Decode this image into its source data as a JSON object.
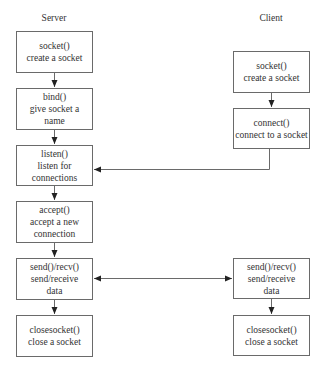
{
  "columns": {
    "server": {
      "title": "Server"
    },
    "client": {
      "title": "Client"
    }
  },
  "server_steps": [
    {
      "call": "socket()",
      "lines": [
        "create a socket"
      ]
    },
    {
      "call": "bind()",
      "lines": [
        "give socket a",
        "name"
      ]
    },
    {
      "call": "listen()",
      "lines": [
        "listen for",
        "connections"
      ]
    },
    {
      "call": "accept()",
      "lines": [
        "accept a new",
        "connection"
      ]
    },
    {
      "call": "send()/recv()",
      "lines": [
        "send/receive",
        "data"
      ]
    },
    {
      "call": "closesocket()",
      "lines": [
        "close a socket"
      ]
    }
  ],
  "client_steps": [
    {
      "call": "socket()",
      "lines": [
        "create a socket"
      ]
    },
    {
      "call": "connect()",
      "lines": [
        "connect to a socket"
      ]
    },
    {
      "call": "send()/recv()",
      "lines": [
        "send/receive",
        "data"
      ]
    },
    {
      "call": "closesocket()",
      "lines": [
        "close a socket"
      ]
    }
  ],
  "edges": [
    {
      "from": "server.socket",
      "to": "server.bind",
      "type": "arrow"
    },
    {
      "from": "server.bind",
      "to": "server.listen",
      "type": "arrow"
    },
    {
      "from": "server.listen",
      "to": "server.accept",
      "type": "arrow"
    },
    {
      "from": "server.accept",
      "to": "server.send_recv",
      "type": "arrow"
    },
    {
      "from": "server.send_recv",
      "to": "server.closesocket",
      "type": "arrow"
    },
    {
      "from": "client.socket",
      "to": "client.connect",
      "type": "arrow"
    },
    {
      "from": "client.connect",
      "to": "server.listen",
      "type": "elbow-arrow"
    },
    {
      "from": "server.send_recv",
      "to": "client.send_recv",
      "type": "bidirectional-arrow"
    },
    {
      "from": "client.send_recv",
      "to": "client.closesocket",
      "type": "arrow"
    }
  ],
  "colors": {
    "line": "#6a6a6a",
    "arrow": "#222222",
    "text": "#333333"
  }
}
